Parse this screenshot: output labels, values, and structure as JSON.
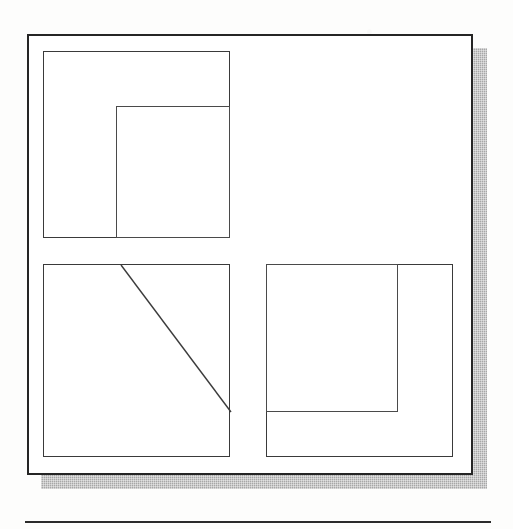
{
  "figure": {
    "kind": "line-drawing",
    "background_color": "#fdfdfc",
    "ink_color": "#252525",
    "shadow_color": "#a7a7a7"
  },
  "frame": {
    "name": "outer frame",
    "x": 27,
    "y": 34,
    "width": 446,
    "height": 441,
    "stroke_width": 2,
    "stroke_color": "#252525",
    "fill_color": "#ffffff"
  },
  "shadow": {
    "name": "drop shadow",
    "offset_x": 14,
    "offset_y": 14,
    "color": "#a7a7a7",
    "pattern": "halftone-dither"
  },
  "panels": [
    {
      "id": "panel-top-left",
      "label": "top-left panel",
      "position": "top-left",
      "x": 14,
      "y": 15,
      "width": 187,
      "height": 187,
      "stroke_color": "#3a3a3a",
      "content": {
        "type": "nested-rectangle",
        "anchor": "bottom-right",
        "inner_x": 72,
        "inner_y": 54,
        "inner_width": 115,
        "inner_height": 133
      }
    },
    {
      "id": "panel-bottom-left",
      "label": "bottom-left panel",
      "position": "bottom-left",
      "x": 14,
      "y": 228,
      "width": 187,
      "height": 193,
      "stroke_color": "#3a3a3a",
      "content": {
        "type": "diagonal-line",
        "x1": 77,
        "y1": 0,
        "x2": 187,
        "y2": 147,
        "stroke_color": "#3c3c3c"
      }
    },
    {
      "id": "panel-bottom-right",
      "label": "bottom-right panel",
      "position": "bottom-right",
      "x": 237,
      "y": 228,
      "width": 187,
      "height": 193,
      "stroke_color": "#3a3a3a",
      "content": {
        "type": "nested-rectangle",
        "anchor": "top-left",
        "inner_x": 0,
        "inner_y": 0,
        "inner_width": 132,
        "inner_height": 148
      }
    }
  ],
  "next_figure_rule": {
    "label": "top rule of the following figure",
    "x": 25,
    "y": 521,
    "width": 466,
    "stroke_width": 2,
    "stroke_color": "#2b2b2b"
  }
}
